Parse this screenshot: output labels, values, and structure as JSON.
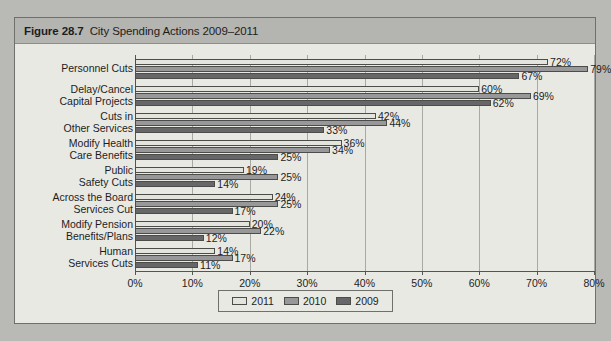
{
  "figure": {
    "number": "Figure 28.7",
    "title": "City Spending Actions 2009–2011"
  },
  "colors": {
    "y2011": "#e4e4df",
    "y2010": "#98989a",
    "y2009": "#67676a",
    "panel_background": "#e9e9e4",
    "title_bar": "#b4b4b0",
    "page_background": "#b9b9b5",
    "axis": "#55554f",
    "gridline": "#a9a9a4"
  },
  "legend": {
    "position": "bottom-center",
    "entries": [
      {
        "label": "2011",
        "color_key": "y2011"
      },
      {
        "label": "2010",
        "color_key": "y2010"
      },
      {
        "label": "2009",
        "color_key": "y2009"
      }
    ]
  },
  "chart_data": {
    "type": "bar",
    "orientation": "horizontal",
    "title": "City Spending Actions 2009–2011",
    "xlabel": "",
    "ylabel": "",
    "xlim": [
      0,
      80
    ],
    "xticks": [
      0,
      10,
      20,
      30,
      40,
      50,
      60,
      70,
      80
    ],
    "xtick_labels": [
      "0%",
      "10%",
      "20%",
      "30%",
      "40%",
      "50%",
      "60%",
      "70%",
      "80%"
    ],
    "grid": true,
    "value_suffix": "%",
    "categories": [
      "Personnel Cuts",
      "Delay/Cancel Capital Projects",
      "Cuts in Other Services",
      "Modify Health Care Benefits",
      "Public Safety Cuts",
      "Across the Board Services Cut",
      "Modify Pension Benefits/Plans",
      "Human Services Cuts"
    ],
    "category_label_lines": [
      [
        "Personnel Cuts"
      ],
      [
        "Delay/Cancel",
        "Capital Projects"
      ],
      [
        "Cuts in",
        "Other Services"
      ],
      [
        "Modify Health",
        "Care Benefits"
      ],
      [
        "Public",
        "Safety Cuts"
      ],
      [
        "Across the Board",
        "Services Cut"
      ],
      [
        "Modify Pension",
        "Benefits/Plans"
      ],
      [
        "Human",
        "Services Cuts"
      ]
    ],
    "series": [
      {
        "name": "2011",
        "color_key": "y2011",
        "values": [
          72,
          60,
          42,
          36,
          19,
          24,
          20,
          14
        ],
        "labels": [
          "72%",
          "60%",
          "42%",
          "36%",
          "19%",
          "24%",
          "20%",
          "14%"
        ]
      },
      {
        "name": "2010",
        "color_key": "y2010",
        "values": [
          79,
          69,
          44,
          34,
          25,
          25,
          22,
          17
        ],
        "labels": [
          "79%",
          "69%",
          "44%",
          "34%",
          "25%",
          "25%",
          "22%",
          "17%"
        ]
      },
      {
        "name": "2009",
        "color_key": "y2009",
        "values": [
          67,
          62,
          33,
          25,
          14,
          17,
          12,
          11
        ],
        "labels": [
          "67%",
          "62%",
          "33%",
          "25%",
          "14%",
          "17%",
          "12%",
          "11%"
        ]
      }
    ]
  }
}
